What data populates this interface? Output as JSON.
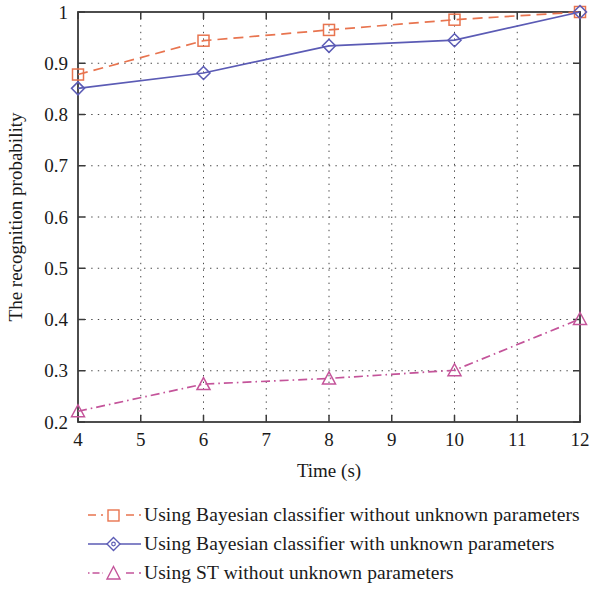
{
  "chart_data": {
    "type": "line",
    "title": "",
    "xlabel": "Time (s)",
    "ylabel": "The recognition probability",
    "xlim": [
      4,
      12
    ],
    "ylim": [
      0.2,
      1.0
    ],
    "xticks": [
      4,
      5,
      6,
      7,
      8,
      9,
      10,
      11,
      12
    ],
    "xtick_labels": [
      "4",
      "5",
      "6",
      "7",
      "8",
      "9",
      "10",
      "11",
      "12"
    ],
    "yticks": [
      0.2,
      0.3,
      0.4,
      0.5,
      0.6,
      0.7,
      0.8,
      0.9,
      1.0
    ],
    "ytick_labels": [
      "0.2",
      "0.3",
      "0.4",
      "0.5",
      "0.6",
      "0.7",
      "0.8",
      "0.9",
      "1"
    ],
    "grid": true,
    "grid_style": "dotted",
    "legend_position": "below-left",
    "x": [
      4,
      6,
      8,
      10,
      12
    ],
    "series": [
      {
        "name": "Using Bayesian classifier without unknown parameters",
        "values": [
          0.878,
          0.944,
          0.965,
          0.985,
          1.0
        ],
        "color": "#e8744f",
        "marker": "square",
        "line_style": "dashed"
      },
      {
        "name": "Using Bayesian classifier with unknown parameters",
        "values": [
          0.851,
          0.881,
          0.934,
          0.945,
          1.0
        ],
        "color": "#5b5bb5",
        "marker": "diamond",
        "line_style": "solid"
      },
      {
        "name": "Using ST without unknown parameters",
        "values": [
          0.221,
          0.274,
          0.285,
          0.301,
          0.401
        ],
        "color": "#c4549a",
        "marker": "triangle",
        "line_style": "dashdot"
      }
    ]
  },
  "legend": {
    "items": [
      {
        "label": "Using Bayesian classifier without unknown parameters"
      },
      {
        "label": "Using Bayesian classifier with unknown parameters"
      },
      {
        "label": "Using ST without unknown parameters"
      }
    ]
  },
  "axes": {
    "x_title": "Time (s)",
    "y_title": "The recognition probability"
  }
}
